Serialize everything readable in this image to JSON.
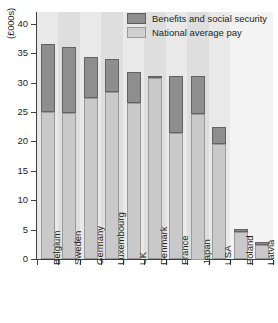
{
  "chart_data": {
    "type": "bar",
    "subtype": "stacked-bar",
    "title": "",
    "xlabel": "",
    "ylabel": "(£000s)",
    "ylim": [
      0,
      42
    ],
    "ytick_values": [
      0,
      5,
      10,
      15,
      20,
      25,
      30,
      35,
      40
    ],
    "ytick_labels": [
      "0",
      "5",
      "10",
      "15",
      "20",
      "25",
      "30",
      "35",
      "40"
    ],
    "grid": false,
    "legend_position": "top-right",
    "categories": [
      "Belgium",
      "Sweden",
      "Germany",
      "Luxembourg",
      "UK",
      "Denmark",
      "France",
      "Japan",
      "USA",
      "Poland",
      "Latvia"
    ],
    "series": [
      {
        "name": "National average pay",
        "color": "#c9c9c9",
        "values": [
          25.0,
          24.8,
          27.3,
          28.4,
          26.5,
          30.8,
          21.5,
          24.8,
          19.5,
          4.6,
          2.4
        ]
      },
      {
        "name": "Benefits and social security",
        "color": "#8e8e8e",
        "values": [
          11.5,
          11.2,
          7.0,
          5.6,
          5.3,
          0.4,
          9.7,
          6.4,
          2.9,
          0.5,
          0.5
        ]
      }
    ],
    "totals": [
      36.5,
      36.0,
      34.3,
      34.0,
      31.8,
      31.2,
      31.2,
      31.2,
      22.4,
      5.1,
      2.9
    ]
  },
  "legend": {
    "items": [
      {
        "label": "Benefits and social security",
        "swatch": "dark-gray-swatch"
      },
      {
        "label": "National average pay",
        "swatch": "light-gray-swatch"
      }
    ]
  },
  "axes": {
    "y_title": "(£000s)"
  }
}
